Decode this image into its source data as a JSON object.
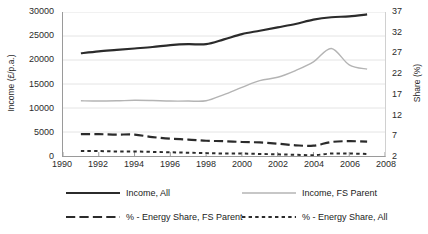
{
  "chart_data": {
    "type": "line",
    "title": "",
    "xlabel": "",
    "ylabel": "Income (£/p.a.)",
    "y2label": "Share (%)",
    "grid": true,
    "legend_position": "bottom",
    "xlim": [
      1990,
      2008
    ],
    "ylim": [
      0,
      30000
    ],
    "y2lim": [
      2,
      37
    ],
    "xticks": [
      "1990",
      "1992",
      "1994",
      "1996",
      "1998",
      "2000",
      "2002",
      "2004",
      "2006",
      "2008"
    ],
    "yticks": [
      "0",
      "5000",
      "10000",
      "15000",
      "20000",
      "25000",
      "30000"
    ],
    "y2ticks": [
      "2",
      "7",
      "12",
      "17",
      "22",
      "27",
      "32",
      "37"
    ],
    "x": [
      1991,
      1992,
      1993,
      1994,
      1995,
      1996,
      1997,
      1998,
      1999,
      2000,
      2001,
      2002,
      2003,
      2004,
      2005,
      2006,
      2007
    ],
    "series": [
      {
        "name": "Income, All",
        "axis": "left",
        "color": "#2b2b2b",
        "style": "solid",
        "width": 2.2,
        "values": [
          21400,
          21800,
          22100,
          22400,
          22700,
          23100,
          23300,
          23300,
          24300,
          25400,
          26100,
          26800,
          27500,
          28400,
          28900,
          29100,
          29500
        ]
      },
      {
        "name": "Income, FS Parent",
        "axis": "left",
        "color": "#b4b4b4",
        "style": "solid",
        "width": 1.4,
        "values": [
          11500,
          11450,
          11500,
          11600,
          11550,
          11450,
          11450,
          11500,
          12800,
          14300,
          15700,
          16400,
          17800,
          19600,
          22400,
          19000,
          18100
        ]
      },
      {
        "name": "% - Energy Share, FS Parent",
        "axis": "right",
        "color": "#2b2b2b",
        "style": "dashed-long",
        "width": 2.2,
        "values": [
          7.3,
          7.3,
          7.2,
          7.2,
          6.6,
          6.2,
          6.0,
          5.7,
          5.6,
          5.4,
          5.3,
          5.0,
          4.6,
          4.5,
          5.4,
          5.6,
          5.5
        ]
      },
      {
        "name": "% - Energy Share, All",
        "axis": "right",
        "color": "#2b2b2b",
        "style": "dotted-short",
        "width": 2.0,
        "values": [
          3.2,
          3.2,
          3.1,
          3.1,
          3.0,
          2.9,
          2.8,
          2.7,
          2.6,
          2.6,
          2.5,
          2.4,
          2.3,
          2.2,
          2.6,
          2.6,
          2.5
        ]
      }
    ]
  }
}
